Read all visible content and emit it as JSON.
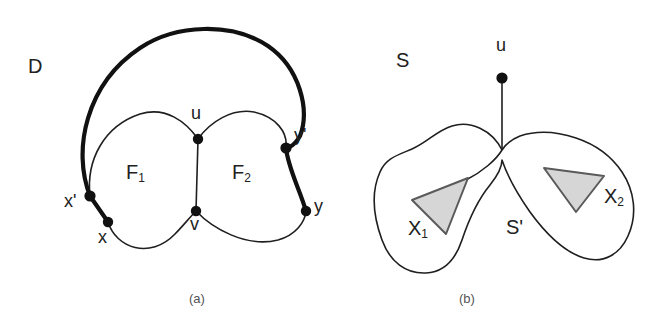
{
  "figure": {
    "panels": [
      {
        "id": "panel-a",
        "caption": "(a)",
        "labels": {
          "region_outer": "D",
          "face_1": "F",
          "face_1_sub": "1",
          "face_2": "F",
          "face_2_sub": "2"
        },
        "nodes": [
          {
            "name": "u",
            "label": "u",
            "x": 198,
            "y": 139,
            "label_x": 191,
            "label_y": 112
          },
          {
            "name": "v",
            "label": "v",
            "x": 196,
            "y": 211,
            "label_x": 190,
            "label_y": 219
          },
          {
            "name": "x",
            "label": "x",
            "x": 108,
            "y": 222,
            "label_x": 100,
            "label_y": 233
          },
          {
            "name": "xp",
            "label": "x'",
            "x": 90,
            "y": 196,
            "label_x": 68,
            "label_y": 198
          },
          {
            "name": "y",
            "label": "y",
            "x": 306,
            "y": 211,
            "label_x": 314,
            "label_y": 202
          },
          {
            "name": "yp",
            "label": "y'",
            "x": 286,
            "y": 148,
            "label_x": 294,
            "label_y": 131
          }
        ]
      },
      {
        "id": "panel-b",
        "caption": "(b)",
        "labels": {
          "region_outer": "S",
          "region_inner": "S'",
          "set_1": "X",
          "set_1_sub": "1",
          "set_2": "X",
          "set_2_sub": "2"
        },
        "nodes": [
          {
            "name": "u",
            "label": "u",
            "x": 502,
            "y": 78,
            "label_x": 496,
            "label_y": 44
          }
        ]
      }
    ],
    "colors": {
      "line": "#1f1f1f",
      "thick_line": "#111111",
      "node_fill": "#111111",
      "shade_fill": "#d6d6d6",
      "background": "#ffffff",
      "text": "#212121",
      "caption_text": "#555555"
    }
  }
}
